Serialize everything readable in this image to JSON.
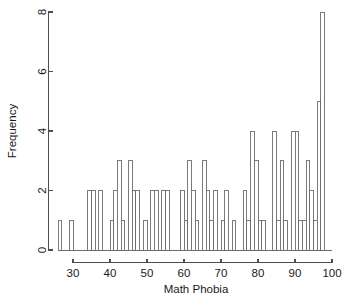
{
  "chart_data": {
    "type": "bar",
    "title": "",
    "xlabel": "Math Phobia",
    "ylabel": "Frequency",
    "xlim": [
      26,
      98
    ],
    "ylim": [
      0,
      8
    ],
    "bin_width": 1,
    "grid": false,
    "legend": null,
    "xticks": [
      30,
      40,
      50,
      60,
      70,
      80,
      90,
      100
    ],
    "xtick_labels": [
      "30",
      "40",
      "50",
      "60",
      "70",
      "80",
      "90",
      "100"
    ],
    "yticks": [
      0,
      2,
      4,
      6,
      8
    ],
    "ytick_labels": [
      "0",
      "2",
      "4",
      "6",
      "8"
    ],
    "categories": [
      27,
      30,
      35,
      36,
      38,
      41,
      42,
      43,
      44,
      45,
      46,
      47,
      48,
      49,
      50,
      52,
      53,
      54,
      55,
      56,
      57,
      61,
      62,
      63,
      64,
      65,
      66,
      67,
      68,
      69,
      70,
      71,
      72,
      73,
      74,
      75,
      77,
      78,
      79,
      80,
      81,
      82,
      83,
      84,
      85,
      86,
      87,
      88,
      89,
      90,
      91,
      92,
      93,
      94,
      95,
      96,
      97
    ],
    "values": [
      1,
      1,
      2,
      2,
      2,
      1,
      2,
      3,
      1,
      3,
      2,
      2,
      2,
      1,
      1,
      2,
      2,
      2,
      2,
      1,
      2,
      2,
      1,
      3,
      2,
      1,
      3,
      2,
      1,
      2,
      1,
      1,
      2,
      1,
      2,
      1,
      2,
      4,
      3,
      1,
      1,
      1,
      1,
      4,
      1,
      3,
      1,
      1,
      4,
      4,
      1,
      3,
      2,
      1,
      5,
      8,
      1
    ],
    "bars": [
      {
        "x": 27,
        "y": 1
      },
      {
        "x": 30,
        "y": 1
      },
      {
        "x": 35,
        "y": 2
      },
      {
        "x": 36,
        "y": 2
      },
      {
        "x": 38,
        "y": 2
      },
      {
        "x": 41,
        "y": 1
      },
      {
        "x": 42,
        "y": 2
      },
      {
        "x": 43,
        "y": 3
      },
      {
        "x": 44,
        "y": 1
      },
      {
        "x": 46,
        "y": 3
      },
      {
        "x": 47,
        "y": 2
      },
      {
        "x": 48,
        "y": 2
      },
      {
        "x": 50,
        "y": 1
      },
      {
        "x": 52,
        "y": 2
      },
      {
        "x": 53,
        "y": 2
      },
      {
        "x": 55,
        "y": 2
      },
      {
        "x": 56,
        "y": 2
      },
      {
        "x": 60,
        "y": 2
      },
      {
        "x": 61,
        "y": 1
      },
      {
        "x": 62,
        "y": 3
      },
      {
        "x": 63,
        "y": 2
      },
      {
        "x": 64,
        "y": 1
      },
      {
        "x": 66,
        "y": 3
      },
      {
        "x": 67,
        "y": 2
      },
      {
        "x": 68,
        "y": 1
      },
      {
        "x": 69,
        "y": 2
      },
      {
        "x": 71,
        "y": 1
      },
      {
        "x": 72,
        "y": 2
      },
      {
        "x": 74,
        "y": 1
      },
      {
        "x": 77,
        "y": 2
      },
      {
        "x": 78,
        "y": 1
      },
      {
        "x": 79,
        "y": 4
      },
      {
        "x": 80,
        "y": 3
      },
      {
        "x": 81,
        "y": 1
      },
      {
        "x": 82,
        "y": 1
      },
      {
        "x": 85,
        "y": 4
      },
      {
        "x": 86,
        "y": 1
      },
      {
        "x": 87,
        "y": 3
      },
      {
        "x": 88,
        "y": 1
      },
      {
        "x": 90,
        "y": 4
      },
      {
        "x": 91,
        "y": 4
      },
      {
        "x": 92,
        "y": 1
      },
      {
        "x": 93,
        "y": 1
      },
      {
        "x": 94,
        "y": 3
      },
      {
        "x": 95,
        "y": 2
      },
      {
        "x": 96,
        "y": 1
      },
      {
        "x": 97,
        "y": 5
      },
      {
        "x": 98,
        "y": 8
      }
    ]
  },
  "axes": {
    "x_title": "Math Phobia",
    "y_title": "Frequency"
  }
}
